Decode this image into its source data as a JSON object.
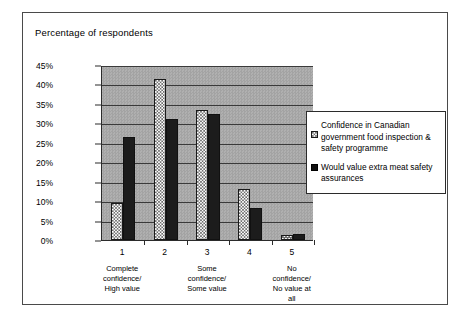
{
  "frame": {
    "title": "Percentage of respondents"
  },
  "legend": {
    "entries": [
      {
        "key": "series-a",
        "label": "Confidence in Canadian government food inspection & safety programme"
      },
      {
        "key": "series-b",
        "label": "Would value extra meat safety assurances"
      }
    ]
  },
  "colors": {
    "plot_background": "#a8a8a8",
    "series_a_fill": "#ffffff",
    "series_b_fill": "#1c1c1c",
    "axis": "#2b2b2b",
    "frame_border": "#4a4a4a"
  },
  "chart_data": {
    "type": "bar",
    "title": "Percentage of respondents",
    "xlabel": "",
    "ylabel": "",
    "ylim": [
      0,
      45
    ],
    "ytick_labels": [
      "0%",
      "5%",
      "10%",
      "15%",
      "20%",
      "25%",
      "30%",
      "35%",
      "40%",
      "45%"
    ],
    "ytick_values": [
      0,
      5,
      10,
      15,
      20,
      25,
      30,
      35,
      40,
      45
    ],
    "grid": true,
    "legend_position": "right",
    "categories": [
      "1",
      "2",
      "3",
      "4",
      "5"
    ],
    "category_descriptions": [
      "Complete confidence/ High value",
      "",
      "Some confidence/ Some value",
      "",
      "No confidence/ No value at all"
    ],
    "category_description_lines": [
      [
        "Complete",
        "confidence/",
        "High value"
      ],
      [],
      [
        "Some",
        "confidence/",
        "Some value"
      ],
      [],
      [
        "No",
        "confidence/",
        "No value at",
        "all"
      ]
    ],
    "series": [
      {
        "name": "Confidence in Canadian government food inspection & safety programme",
        "values": [
          9.5,
          41.5,
          33.5,
          13.0,
          1.3
        ]
      },
      {
        "name": "Would value extra meat safety assurances",
        "values": [
          26.5,
          31.0,
          32.3,
          8.2,
          1.5
        ]
      }
    ]
  }
}
